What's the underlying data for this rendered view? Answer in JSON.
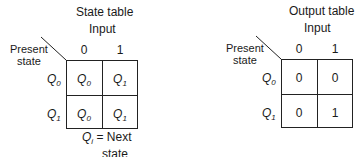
{
  "state_table": {
    "title": "State table",
    "input_label": "Input",
    "present_state_label": [
      "Present",
      "state"
    ],
    "columns": [
      "0",
      "1"
    ],
    "rows": [
      {
        "state": "Q",
        "state_sub": "0",
        "cells": [
          {
            "v": "Q",
            "s": "0"
          },
          {
            "v": "Q",
            "s": "1"
          }
        ]
      },
      {
        "state": "Q",
        "state_sub": "1",
        "cells": [
          {
            "v": "Q",
            "s": "0"
          },
          {
            "v": "Q",
            "s": "1"
          }
        ]
      }
    ],
    "footnote": {
      "symbol": "Q",
      "sub": "i",
      "text": "= Next",
      "text2": "state"
    }
  },
  "output_table": {
    "title": "Output table",
    "input_label": "Input",
    "present_state_label": [
      "Present",
      "state"
    ],
    "columns": [
      "0",
      "1"
    ],
    "rows": [
      {
        "state": "Q",
        "state_sub": "0",
        "cells": [
          "0",
          "0"
        ]
      },
      {
        "state": "Q",
        "state_sub": "1",
        "cells": [
          "0",
          "1"
        ]
      }
    ]
  }
}
